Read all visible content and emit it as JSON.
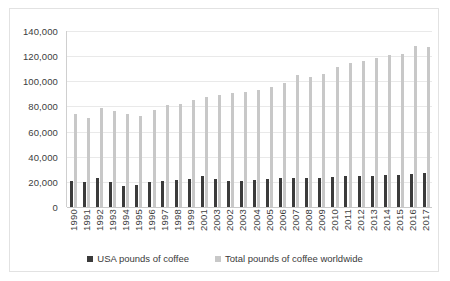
{
  "chart_data": {
    "type": "bar",
    "title": "",
    "xlabel": "",
    "ylabel": "",
    "ylim": [
      0,
      140000
    ],
    "ytick_labels": [
      "0",
      "20,000",
      "40,000",
      "60,000",
      "80,000",
      "100,000",
      "120,000",
      "140,000"
    ],
    "ytick_values": [
      0,
      20000,
      40000,
      60000,
      80000,
      100000,
      120000,
      140000
    ],
    "grid": true,
    "legend_position": "bottom",
    "categories": [
      "1990",
      "1991",
      "1992",
      "1993",
      "1994",
      "1995",
      "1996",
      "1997",
      "1998",
      "1999",
      "2001",
      "2003",
      "2002",
      "2003",
      "2004",
      "2005",
      "2006",
      "2007",
      "2008",
      "2009",
      "2010",
      "2011",
      "2012",
      "2013",
      "2014",
      "2015",
      "2016",
      "2017"
    ],
    "series": [
      {
        "name": "USA pounds of coffee",
        "color": "#3b3b3b",
        "values": [
          20800,
          19800,
          22800,
          20200,
          17000,
          17800,
          20200,
          20400,
          21200,
          22300,
          24600,
          21900,
          21000,
          21000,
          21700,
          22500,
          22700,
          22800,
          22700,
          22900,
          24200,
          24800,
          24400,
          24500,
          25400,
          25300,
          26300,
          26800
        ]
      },
      {
        "name": "Total pounds of coffee worldwide",
        "color": "#c8c8c8",
        "values": [
          74200,
          71000,
          78800,
          76500,
          74000,
          72500,
          77500,
          80800,
          82200,
          85200,
          87800,
          89200,
          90500,
          91500,
          93200,
          95800,
          98800,
          105200,
          103200,
          105800,
          111000,
          114200,
          115800,
          118200,
          120800,
          121800,
          128200,
          127200
        ]
      }
    ]
  },
  "legend": {
    "items": [
      {
        "label": "USA pounds of coffee"
      },
      {
        "label": "Total pounds of coffee worldwide"
      }
    ]
  }
}
